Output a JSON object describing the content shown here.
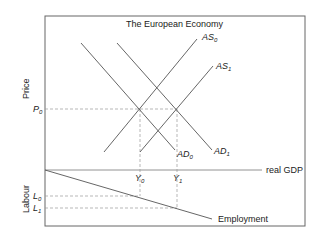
{
  "title": "The European Economy",
  "axes": {
    "y_upper": "Price",
    "y_lower": "Labour",
    "x": "real GDP"
  },
  "curves": {
    "as0": {
      "base": "AS",
      "sub": "0"
    },
    "as1": {
      "base": "AS",
      "sub": "1"
    },
    "ad0": {
      "base": "AD",
      "sub": "0"
    },
    "ad1": {
      "base": "AD",
      "sub": "1"
    },
    "employment": "Employment"
  },
  "markers": {
    "p0": {
      "base": "P",
      "sub": "0"
    },
    "y0": {
      "base": "Y",
      "sub": "0"
    },
    "y1": {
      "base": "Y",
      "sub": "1"
    },
    "l0": {
      "base": "L",
      "sub": "0"
    },
    "l1": {
      "base": "L",
      "sub": "1"
    }
  },
  "colors": {
    "line": "#555555",
    "dash": "#9a9a9a",
    "frame": "#666666"
  }
}
